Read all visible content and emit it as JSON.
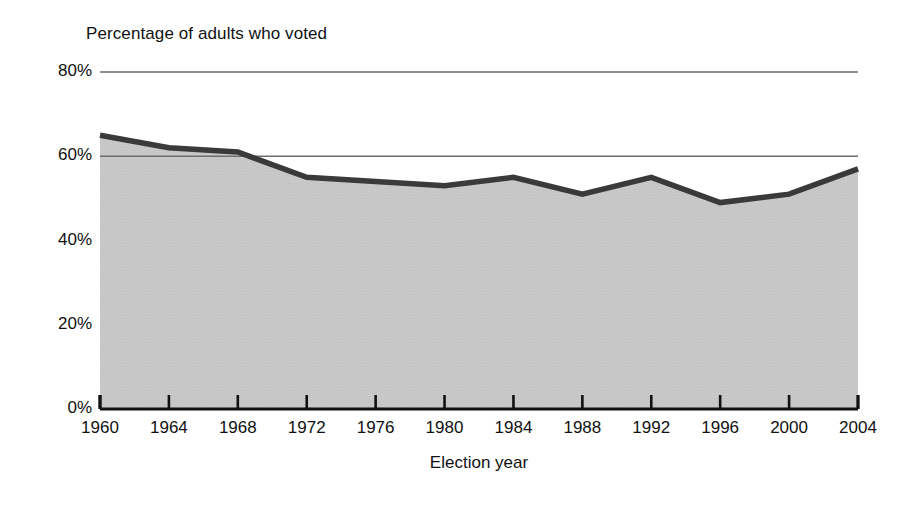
{
  "figure": {
    "y_axis_caption": "Percentage of adults who voted",
    "x_axis_caption": "Election year"
  },
  "chart_data": {
    "type": "area",
    "title": "Percentage of adults who voted",
    "xlabel": "Election year",
    "ylabel": "Percentage of adults who voted",
    "categories": [
      1960,
      1964,
      1968,
      1972,
      1976,
      1980,
      1984,
      1988,
      1992,
      1996,
      2000,
      2004
    ],
    "x_tick_labels": [
      "1960",
      "1964",
      "1968",
      "1972",
      "1976",
      "1980",
      "1984",
      "1988",
      "1992",
      "1996",
      "2000",
      "2004"
    ],
    "values": [
      65,
      62,
      61,
      55,
      54,
      53,
      55,
      51,
      55,
      49,
      51,
      57
    ],
    "y_tick_labels": [
      "0%",
      "20%",
      "40%",
      "60%",
      "80%"
    ],
    "y_tick_values": [
      0,
      20,
      40,
      60,
      80
    ],
    "ylim": [
      0,
      80
    ],
    "xlim": [
      1960,
      2004
    ],
    "grid": "horizontal gridlines at 60% and 80% only",
    "gridline_values": [
      60,
      80
    ],
    "legend": "none",
    "series": [
      {
        "name": "Percentage of adults who voted",
        "values": [
          65,
          62,
          61,
          55,
          54,
          53,
          55,
          51,
          55,
          49,
          51,
          57
        ]
      }
    ],
    "colors": {
      "fill": "#c9c9c9",
      "line": "#3a3a3a",
      "axis": "#111111",
      "gridline": "#6d6d6d",
      "background": "#ffffff"
    }
  }
}
